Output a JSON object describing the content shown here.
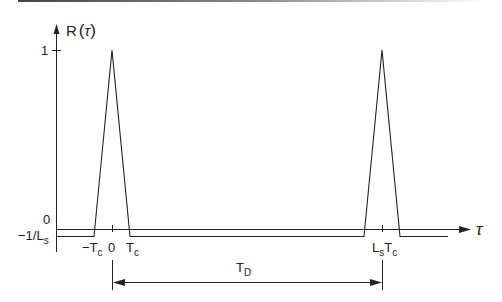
{
  "diagram": {
    "type": "autocorrelation-plot",
    "y_axis": {
      "label_main": "R",
      "label_open": "(",
      "label_var": "τ",
      "label_close": ")",
      "tick_one": "1",
      "tick_zero": "0",
      "tick_neg_main": "−1/L",
      "tick_neg_sub": "s"
    },
    "x_axis": {
      "label": "τ",
      "tick_neg_tc_main": "−T",
      "tick_neg_tc_sub": "c",
      "tick_zero": "0",
      "tick_tc_main": "T",
      "tick_tc_sub": "c",
      "tick_period_main_1": "L",
      "tick_period_sub_1": "s",
      "tick_period_main_2": "T",
      "tick_period_sub_2": "c"
    },
    "period_marker": {
      "label_main": "T",
      "label_sub": "D"
    },
    "colors": {
      "line": "#222222",
      "header_rule": "#555555"
    }
  }
}
